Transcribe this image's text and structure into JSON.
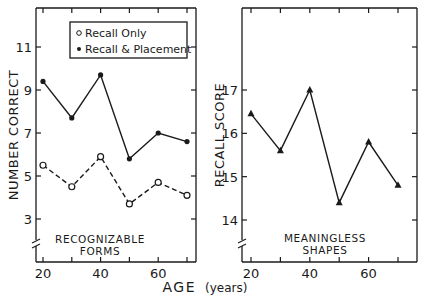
{
  "chart_data": [
    {
      "type": "line",
      "panel": "left",
      "title": "",
      "annotation": [
        "RECOGNIZABLE",
        "FORMS"
      ],
      "xlabel": "AGE (years)",
      "ylabel": "NUMBER CORRECT",
      "x": [
        20,
        30,
        40,
        50,
        60,
        70
      ],
      "xticks": [
        "20",
        "40",
        "60"
      ],
      "yticks": [
        "3",
        "5",
        "7",
        "9",
        "11"
      ],
      "ylim": [
        1.5,
        12.5
      ],
      "xlim": [
        17,
        74
      ],
      "grid": false,
      "legend_position": "upper right",
      "series": [
        {
          "name": "Recall Only",
          "marker": "open-circle",
          "line": "dashed",
          "values": [
            5.5,
            4.5,
            5.9,
            3.7,
            4.7,
            4.1
          ]
        },
        {
          "name": "Recall & Placement",
          "marker": "filled-circle",
          "line": "solid",
          "values": [
            9.4,
            7.7,
            9.7,
            5.8,
            7.0,
            6.6
          ]
        }
      ]
    },
    {
      "type": "line",
      "panel": "right",
      "title": "",
      "annotation": [
        "MEANINGLESS",
        "SHAPES"
      ],
      "xlabel": "AGE (years)",
      "ylabel": "RECALL SCORE",
      "x": [
        20,
        30,
        40,
        50,
        60,
        70
      ],
      "xticks": [
        "20",
        "40",
        "60"
      ],
      "yticks": [
        "14",
        "15",
        "16",
        "17"
      ],
      "ylim": [
        13.2,
        18.6
      ],
      "xlim": [
        17,
        74
      ],
      "grid": false,
      "series": [
        {
          "name": "Recall Score",
          "marker": "filled-triangle",
          "line": "solid",
          "values": [
            16.45,
            15.6,
            17.0,
            14.4,
            15.8,
            14.8
          ]
        }
      ]
    }
  ],
  "labels": {
    "left_ylabel": "NUMBER CORRECT",
    "right_ylabel": "RECALL SCORE",
    "xlabel_main": "AGE",
    "xlabel_unit": "(years)",
    "legend_open": "Recall Only",
    "legend_filled": "Recall & Placement",
    "left_note_1": "RECOGNIZABLE",
    "left_note_2": "FORMS",
    "right_note_1": "MEANINGLESS",
    "right_note_2": "SHAPES"
  }
}
